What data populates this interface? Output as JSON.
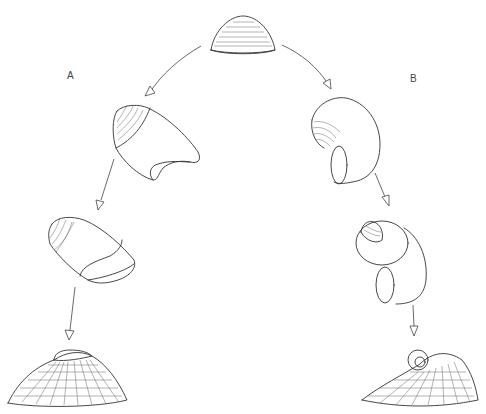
{
  "diagram": {
    "type": "evolutionary-pathway",
    "labels": {
      "branch_a": "A",
      "branch_b": "B"
    },
    "nodes": [
      {
        "id": "ancestor",
        "description": "cap-shaped (limpet-like) shell with growth lines",
        "branch": "root"
      },
      {
        "id": "a1",
        "description": "slightly coiled shell with oblique aperture",
        "branch": "A"
      },
      {
        "id": "a2",
        "description": "elongate oval shell with septum",
        "branch": "A"
      },
      {
        "id": "a3",
        "description": "cap-shaped shell with small apical coil and reticulate sculpture",
        "branch": "A"
      },
      {
        "id": "b1",
        "description": "coiled shell with rounded aperture",
        "branch": "B"
      },
      {
        "id": "b2",
        "description": "tightly coiled spiral shell",
        "branch": "B"
      },
      {
        "id": "b3",
        "description": "cap-shaped shell with spiral protoconch and reticulate sculpture",
        "branch": "B"
      }
    ],
    "edges": [
      {
        "from": "ancestor",
        "to": "a1"
      },
      {
        "from": "a1",
        "to": "a2"
      },
      {
        "from": "a2",
        "to": "a3"
      },
      {
        "from": "ancestor",
        "to": "b1"
      },
      {
        "from": "b1",
        "to": "b2"
      },
      {
        "from": "b2",
        "to": "b3"
      }
    ]
  }
}
